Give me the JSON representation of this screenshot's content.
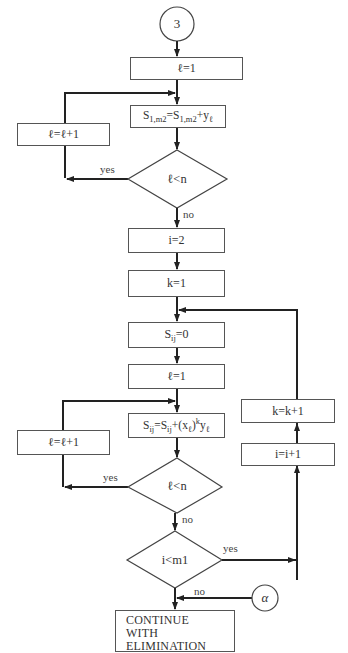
{
  "connectors": {
    "start": "3",
    "alpha": "α"
  },
  "section1": {
    "init_l": "ℓ=1",
    "update_sum": {
      "lhs": "S",
      "lhs_sub": "1,m2",
      "eq": "=S",
      "rhs_sub": "1,m2",
      "plus": "+y",
      "y_sub": "ℓ"
    },
    "increment_l": "ℓ=ℓ+1",
    "decision": "ℓ<n",
    "yes_label": "yes",
    "no_label": "no"
  },
  "section2": {
    "init_i": "i=2",
    "init_k": "k=1",
    "reset_sij": {
      "s": "S",
      "sub": "ij",
      "rest": "=0"
    },
    "init_l": "ℓ=1",
    "update_sij": {
      "s": "S",
      "sub": "ij",
      "eq": "=S",
      "sub2": "ij",
      "mid": "+(x",
      "x_sub": "ℓ",
      "close": ")",
      "pow": "k",
      "y": "y",
      "y_sub": "ℓ"
    },
    "increment_l": "ℓ=ℓ+1",
    "decision_l": "ℓ<n",
    "yes_label_l": "yes",
    "no_label_l": "no",
    "decision_i": "i<m1",
    "yes_label_i": "yes",
    "no_label_i": "no",
    "increment_i": "i=i+1",
    "increment_k": "k=k+1"
  },
  "final": {
    "line1": "CONTINUE",
    "line2": "WITH ELIMINATION",
    "line3": "METHOD"
  }
}
